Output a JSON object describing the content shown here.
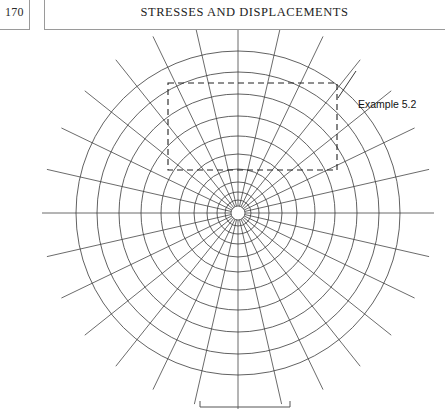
{
  "page": {
    "folio": "170",
    "running_head": "STRESSES AND DISPLACEMENTS"
  },
  "figure": {
    "callout_label": "Example 5.2",
    "center": {
      "x": 238,
      "y": 213
    },
    "radial_lines": 28,
    "radial_line_spacing_deg": 12.857,
    "radial_line_outer_extent": 196,
    "circle_count": 11,
    "circle_radii": [
      7,
      13,
      21,
      31,
      44,
      59,
      77,
      97,
      119,
      141,
      162
    ],
    "dashed_rect": {
      "x": 168,
      "y": 83,
      "width": 169,
      "height": 87
    },
    "leader_line": {
      "x1": 356,
      "y1": 71,
      "x2": 338,
      "y2": 98
    },
    "scale_bar": {
      "x1": 200,
      "y1": 407,
      "x2": 290,
      "tick_height": 6
    },
    "colors": {
      "ink": "#2b2b2b",
      "grid": "#3a3a3a",
      "rule": "#9a9a9a",
      "background": "#ffffff"
    }
  }
}
